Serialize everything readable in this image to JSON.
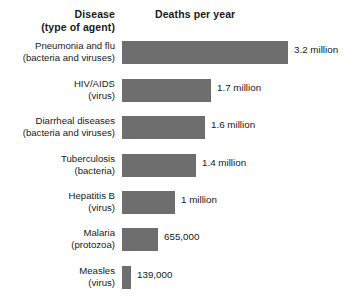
{
  "header": {
    "disease_label_line1": "Disease",
    "disease_label_line2": "(type of agent)",
    "deaths_label": "Deaths per year"
  },
  "style": {
    "bar_color": "#6e6e6e",
    "text_color": "#1a1a1a",
    "background": "#ffffff"
  },
  "chart_data": {
    "type": "bar",
    "orientation": "horizontal",
    "title": "",
    "subtitle": "",
    "xlabel": "Deaths per year",
    "ylabel": "Disease (type of agent)",
    "grid": false,
    "legend": null,
    "axis_visible": false,
    "tick_labels": [],
    "xlim": [
      0,
      3200000
    ],
    "categories": [
      "Pneumonia and flu",
      "HIV/AIDS",
      "Diarrheal diseases",
      "Tuberculosis",
      "Hepatitis B",
      "Malaria",
      "Measles"
    ],
    "agents": [
      "(bacteria and viruses)",
      "(virus)",
      "(bacteria and viruses)",
      "(bacteria)",
      "(virus)",
      "(protozoa)",
      "(virus)"
    ],
    "values": [
      3200000,
      1700000,
      1600000,
      1400000,
      1000000,
      655000,
      139000
    ],
    "value_labels": [
      "3.2 million",
      "1.7 million",
      "1.6 million",
      "1.4 million",
      "1 million",
      "655,000",
      "139,000"
    ],
    "rows": [
      {
        "disease": "Pneumonia and flu",
        "agent": "(bacteria and viruses)",
        "value": 3200000,
        "value_label": "3.2 million",
        "bar_width_px": 166
      },
      {
        "disease": "HIV/AIDS",
        "agent": "(virus)",
        "value": 1700000,
        "value_label": "1.7 million",
        "bar_width_px": 89
      },
      {
        "disease": "Diarrheal diseases",
        "agent": "(bacteria and viruses)",
        "value": 1600000,
        "value_label": "1.6 million",
        "bar_width_px": 83
      },
      {
        "disease": "Tuberculosis",
        "agent": "(bacteria)",
        "value": 1400000,
        "value_label": "1.4 million",
        "bar_width_px": 74
      },
      {
        "disease": "Hepatitis B",
        "agent": "(virus)",
        "value": 1000000,
        "value_label": "1 million",
        "bar_width_px": 53
      },
      {
        "disease": "Malaria",
        "agent": "(protozoa)",
        "value": 655000,
        "value_label": "655,000",
        "bar_width_px": 36
      },
      {
        "disease": "Measles",
        "agent": "(virus)",
        "value": 139000,
        "value_label": "139,000",
        "bar_width_px": 9
      }
    ]
  }
}
